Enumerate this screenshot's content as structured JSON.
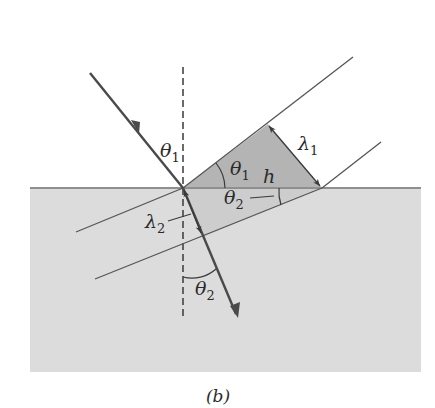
{
  "figure": {
    "caption": "(b)",
    "colors": {
      "background": "#ffffff",
      "medium2": "#dcdcdc",
      "interface": "#8f8f8f",
      "triangle_upper": "#b4b4b4",
      "triangle_lower": "#cdcdcd",
      "ray": "#4a4a4a",
      "wavefront": "#555555",
      "normal": "#3a3a3a"
    },
    "labels": {
      "theta1_incident": {
        "sym": "θ",
        "sub": "1"
      },
      "theta1_triangle": {
        "sym": "θ",
        "sub": "1"
      },
      "lambda1": {
        "sym": "λ",
        "sub": "1"
      },
      "h": {
        "sym": "h"
      },
      "theta2_triangle": {
        "sym": "θ",
        "sub": "2"
      },
      "lambda2": {
        "sym": "λ",
        "sub": "2"
      },
      "theta2_refracted": {
        "sym": "θ",
        "sub": "2"
      }
    }
  }
}
